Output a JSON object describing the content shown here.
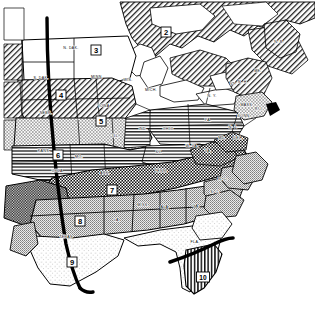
{
  "map": {
    "title": "Thematic zone map of the central and eastern United States",
    "description": "Black-and-white line map with numbered pattern-coded zones, state abbreviations, a heavy north-south meridian line through the Great Plains, and a heavy line across southern Florida.",
    "background_color": "#ffffff",
    "ink_color": "#000000",
    "zones": [
      {
        "id": "zone-2",
        "number": "2",
        "x": 166,
        "y": 32,
        "pattern": "diagonal-hatch",
        "region": "southern Canada / Great Lakes north shore"
      },
      {
        "id": "zone-3",
        "number": "3",
        "x": 96,
        "y": 50,
        "pattern": "white-blank",
        "region": "Minnesota / Upper Midwest"
      },
      {
        "id": "zone-4",
        "number": "4",
        "x": 61,
        "y": 95,
        "pattern": "diagonal-hatch",
        "region": "Nebraska / Iowa / South Dakota"
      },
      {
        "id": "zone-5",
        "number": "5",
        "x": 101,
        "y": 121,
        "pattern": "fine-stipple",
        "region": "Iowa / Illinois / Missouri border"
      },
      {
        "id": "zone-6",
        "number": "6",
        "x": 58,
        "y": 155,
        "pattern": "horizontal-lines",
        "region": "Kansas / Missouri"
      },
      {
        "id": "zone-7",
        "number": "7",
        "x": 112,
        "y": 190,
        "pattern": "dense-checker",
        "region": "Arkansas / Tennessee / Appalachian belt"
      },
      {
        "id": "zone-8",
        "number": "8",
        "x": 80,
        "y": 221,
        "pattern": "mid-gray",
        "region": "Texas / Gulf states"
      },
      {
        "id": "zone-9",
        "number": "9",
        "x": 72,
        "y": 262,
        "pattern": "white-blank",
        "region": "South Texas"
      },
      {
        "id": "zone-10",
        "number": "10",
        "x": 203,
        "y": 277,
        "pattern": "vertical-hatch",
        "region": "South Florida"
      }
    ],
    "states": [
      {
        "abbr": "N. DAK.",
        "x": 71,
        "y": 49
      },
      {
        "abbr": "S. DAK.",
        "x": 41,
        "y": 79
      },
      {
        "abbr": "MINN.",
        "x": 97,
        "y": 78
      },
      {
        "abbr": "WIS.",
        "x": 128,
        "y": 81
      },
      {
        "abbr": "MICH.",
        "x": 151,
        "y": 91
      },
      {
        "abbr": "IOWA",
        "x": 104,
        "y": 107
      },
      {
        "abbr": "NEBR.",
        "x": 46,
        "y": 114
      },
      {
        "abbr": "KANS.",
        "x": 44,
        "y": 152
      },
      {
        "abbr": "MO.",
        "x": 79,
        "y": 158
      },
      {
        "abbr": "ILL.",
        "x": 116,
        "y": 137
      },
      {
        "abbr": "IND.",
        "x": 143,
        "y": 130
      },
      {
        "abbr": "OHIO",
        "x": 168,
        "y": 130
      },
      {
        "abbr": "KY.",
        "x": 159,
        "y": 153
      },
      {
        "abbr": "TENN.",
        "x": 161,
        "y": 172
      },
      {
        "abbr": "W. VA.",
        "x": 192,
        "y": 147
      },
      {
        "abbr": "VA.",
        "x": 208,
        "y": 152
      },
      {
        "abbr": "PA.",
        "x": 208,
        "y": 121
      },
      {
        "abbr": "N. Y.",
        "x": 212,
        "y": 97
      },
      {
        "abbr": "N. J.",
        "x": 233,
        "y": 128
      },
      {
        "abbr": "DEL.",
        "x": 238,
        "y": 139
      },
      {
        "abbr": "MD.",
        "x": 222,
        "y": 139
      },
      {
        "abbr": "MASS.",
        "x": 247,
        "y": 106
      },
      {
        "abbr": "CONN.",
        "x": 244,
        "y": 117
      },
      {
        "abbr": "R. I.",
        "x": 259,
        "y": 110
      },
      {
        "abbr": "VT.",
        "x": 233,
        "y": 85
      },
      {
        "abbr": "N. H.",
        "x": 243,
        "y": 83
      },
      {
        "abbr": "ME.",
        "x": 258,
        "y": 72
      },
      {
        "abbr": "N. C.",
        "x": 223,
        "y": 180
      },
      {
        "abbr": "S. C.",
        "x": 215,
        "y": 193
      },
      {
        "abbr": "GA.",
        "x": 196,
        "y": 207
      },
      {
        "abbr": "ALA.",
        "x": 165,
        "y": 208
      },
      {
        "abbr": "MISS.",
        "x": 143,
        "y": 206
      },
      {
        "abbr": "LA.",
        "x": 117,
        "y": 221
      },
      {
        "abbr": "ARK.",
        "x": 105,
        "y": 174
      },
      {
        "abbr": "OKLA.",
        "x": 58,
        "y": 172
      },
      {
        "abbr": "TEXAS",
        "x": 66,
        "y": 238
      },
      {
        "abbr": "FLA.",
        "x": 195,
        "y": 243
      },
      {
        "abbr": "N. B.",
        "x": 279,
        "y": 43
      }
    ],
    "heavy_lines": [
      {
        "name": "meridian-line",
        "description": "Heavy vertical line running from the Canadian border through the Great Plains to the Gulf of Mexico"
      },
      {
        "name": "florida-cross-line",
        "description": "Heavy diagonal line crossing southern Florida"
      }
    ]
  }
}
